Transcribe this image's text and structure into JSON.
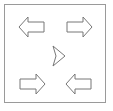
{
  "canvas": {
    "width": 113,
    "height": 111,
    "background_color": "#ffffff"
  },
  "frame": {
    "label": "diagram-border",
    "x": 4.5,
    "y": 4.5,
    "width": 101,
    "height": 98,
    "stroke_color": "#9a9a9a",
    "stroke_width": 1,
    "fill_color": "#ffffff"
  },
  "style": {
    "arrow_stroke_color": "#777777",
    "arrow_fill_color": "#ffffff",
    "arrow_stroke_width": 1
  },
  "shapes": [
    {
      "name": "arrow-top-left",
      "direction": "left",
      "type": "block-arrow",
      "center_x": 31,
      "center_y": 27,
      "points": "19,27 28,17 28,22 44,22 44,32 28,32 28,37"
    },
    {
      "name": "arrow-top-right",
      "direction": "right",
      "type": "block-arrow",
      "center_x": 80,
      "center_y": 27,
      "points": "92,27 83,17 83,22 67,22 67,32 83,32 83,37"
    },
    {
      "name": "arrow-center",
      "direction": "right",
      "type": "arrowhead",
      "center_x": 56,
      "center_y": 56,
      "points": "65,56 53,46 56,56 53,66"
    },
    {
      "name": "arrow-bottom-left",
      "direction": "right",
      "type": "block-arrow",
      "center_x": 31,
      "center_y": 84,
      "points": "45,84 36,74 36,79 20,79 20,89 36,89 36,94"
    },
    {
      "name": "arrow-bottom-right",
      "direction": "left",
      "type": "block-arrow",
      "center_x": 80,
      "center_y": 84,
      "points": "66,84 75,74 75,79 91,79 91,89 75,89 75,94"
    }
  ],
  "meta": {
    "title": "Four block arrows around a central arrowhead",
    "shape_count": 5
  }
}
